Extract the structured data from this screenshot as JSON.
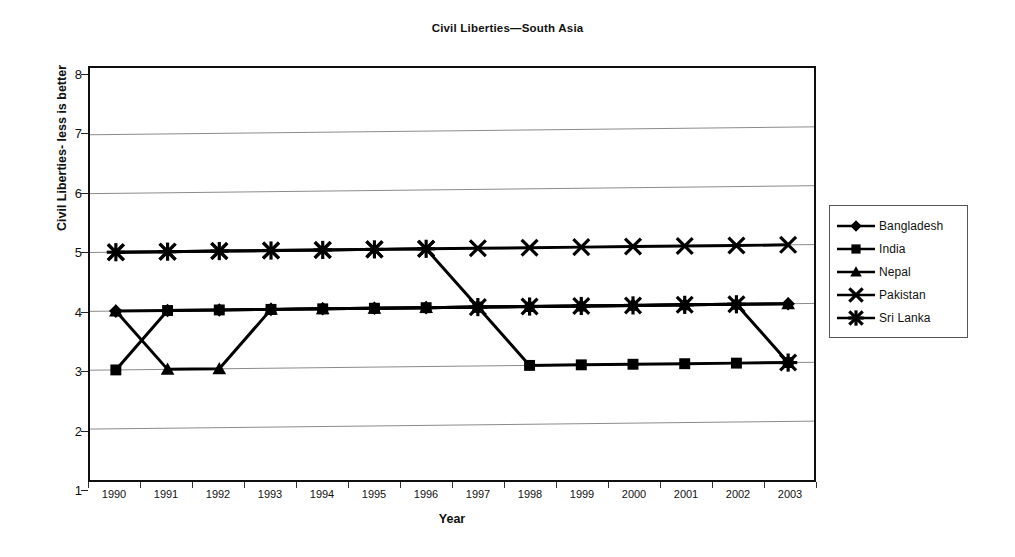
{
  "chart_data": {
    "type": "line",
    "title": "Civil Liberties—South Asia",
    "xlabel": "Year",
    "ylabel": "Civil Liberties- less is better",
    "categories": [
      "1990",
      "1991",
      "1992",
      "1993",
      "1994",
      "1995",
      "1996",
      "1997",
      "1998",
      "1999",
      "2000",
      "2001",
      "2002",
      "2003"
    ],
    "x": [
      1990,
      1991,
      1992,
      1993,
      1994,
      1995,
      1996,
      1997,
      1998,
      1999,
      2000,
      2001,
      2002,
      2003
    ],
    "ylim": [
      1,
      8
    ],
    "yticks": [
      1,
      2,
      3,
      4,
      5,
      6,
      7,
      8
    ],
    "grid": true,
    "legend_position": "right",
    "series": [
      {
        "name": "Bangladesh",
        "marker": "diamond",
        "values": [
          4,
          4,
          4,
          4,
          4,
          4,
          4,
          4,
          4,
          4,
          4,
          4,
          4,
          4
        ]
      },
      {
        "name": "India",
        "marker": "square",
        "values": [
          3,
          4,
          4,
          4,
          4,
          4,
          4,
          4,
          3,
          3,
          3,
          3,
          3,
          3
        ]
      },
      {
        "name": "Nepal",
        "marker": "triangle",
        "values": [
          4,
          3,
          3,
          4,
          4,
          4,
          4,
          4,
          4,
          4,
          4,
          4,
          4,
          4
        ]
      },
      {
        "name": "Pakistan",
        "marker": "x",
        "values": [
          5,
          5,
          5,
          5,
          5,
          5,
          5,
          5,
          5,
          5,
          5,
          5,
          5,
          5
        ]
      },
      {
        "name": "Sri Lanka",
        "marker": "star",
        "values": [
          5,
          5,
          5,
          5,
          5,
          5,
          5,
          4,
          4,
          4,
          4,
          4,
          4,
          3
        ]
      }
    ]
  },
  "legend": {
    "items": [
      {
        "label": "Bangladesh"
      },
      {
        "label": "India"
      },
      {
        "label": "Nepal"
      },
      {
        "label": "Pakistan"
      },
      {
        "label": "Sri Lanka"
      }
    ]
  },
  "colors": {
    "series": "#000000",
    "grid": "#8a8a8a",
    "frame": "#0f0f0f",
    "background": "#ffffff"
  }
}
